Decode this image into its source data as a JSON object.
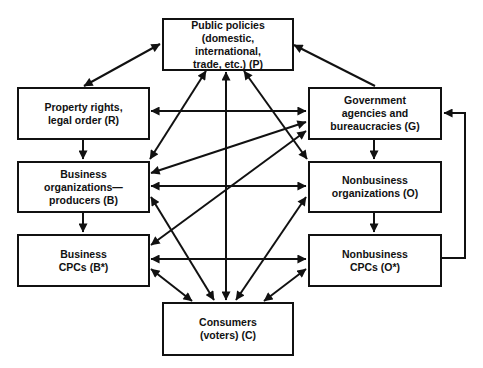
{
  "diagram": {
    "nodes": {
      "P": {
        "label": "Public policies\n(domestic,\ninternational,\ntrade, etc.) (P)"
      },
      "R": {
        "label": "Property rights,\nlegal order (R)"
      },
      "G": {
        "label": "Government\nagencies and\nbureaucracies (G)"
      },
      "B": {
        "label": "Business\norganizations—\nproducers (B)"
      },
      "O": {
        "label": "Nonbusiness\norganizations (O)"
      },
      "Bstar": {
        "label": "Business\nCPCs (B*)"
      },
      "Ostar": {
        "label": "Nonbusiness\nCPCs (O*)"
      },
      "C": {
        "label": "Consumers\n(voters) (C)"
      }
    },
    "edges": [
      {
        "from": "P",
        "to": "R",
        "type": "bidirectional"
      },
      {
        "from": "G",
        "to": "P",
        "type": "directed"
      },
      {
        "from": "R",
        "to": "G",
        "type": "bidirectional"
      },
      {
        "from": "P",
        "to": "B",
        "type": "bidirectional"
      },
      {
        "from": "P",
        "to": "C",
        "type": "bidirectional"
      },
      {
        "from": "P",
        "to": "O",
        "type": "bidirectional"
      },
      {
        "from": "G",
        "to": "B",
        "type": "bidirectional"
      },
      {
        "from": "G",
        "to": "Bstar",
        "type": "bidirectional"
      },
      {
        "from": "R",
        "to": "B",
        "type": "directed"
      },
      {
        "from": "B",
        "to": "Bstar",
        "type": "directed"
      },
      {
        "from": "G",
        "to": "O",
        "type": "directed"
      },
      {
        "from": "O",
        "to": "Ostar",
        "type": "directed"
      },
      {
        "from": "B",
        "to": "O",
        "type": "bidirectional"
      },
      {
        "from": "Bstar",
        "to": "Ostar",
        "type": "bidirectional"
      },
      {
        "from": "Ostar",
        "to": "G",
        "type": "directed"
      },
      {
        "from": "B",
        "to": "C",
        "type": "bidirectional"
      },
      {
        "from": "O",
        "to": "C",
        "type": "bidirectional"
      },
      {
        "from": "Bstar",
        "to": "C",
        "type": "bidirectional"
      },
      {
        "from": "Ostar",
        "to": "C",
        "type": "bidirectional"
      }
    ]
  }
}
